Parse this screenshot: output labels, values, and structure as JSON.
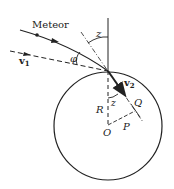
{
  "diagram": {
    "labels": {
      "meteor": "Meteor",
      "v1": "v",
      "v1_sub": "1",
      "v2": "v",
      "v2_sub": "2",
      "z_top": "z",
      "z_inner": "z",
      "phi": "φ",
      "R": "R",
      "O": "O",
      "P": "P",
      "Q": "Q"
    },
    "colors": {
      "stroke": "#222222",
      "background": "#ffffff"
    }
  }
}
